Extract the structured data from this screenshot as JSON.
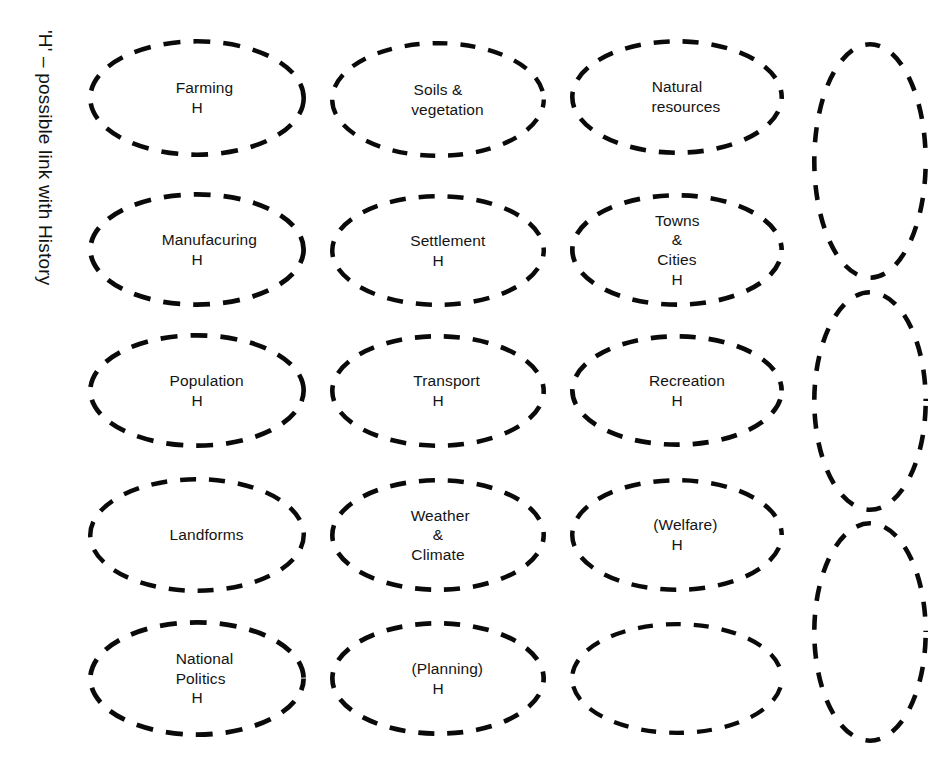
{
  "legend": {
    "text": "'H' – possible link with History"
  },
  "style": {
    "stroke_color": "#0a0a0a",
    "background": "#ffffff",
    "text_color": "#141414"
  },
  "grid": {
    "columns": 4,
    "rows": 5
  },
  "nodes": [
    {
      "id": "farming",
      "label": "Farming",
      "h": "H",
      "row": 1,
      "col": 1,
      "x": 88,
      "y": 39,
      "w": 218,
      "h_px": 118,
      "dash": "17 13",
      "width_px": 4.6
    },
    {
      "id": "soils",
      "label": "Soils &\nvegetation",
      "h": "",
      "row": 1,
      "col": 2,
      "x": 330,
      "y": 41,
      "w": 216,
      "h_px": 117,
      "dash": "15 13",
      "width_px": 4.4
    },
    {
      "id": "natural",
      "label": "Natural\nresources",
      "h": "",
      "row": 1,
      "col": 3,
      "x": 570,
      "y": 39,
      "w": 214,
      "h_px": 116,
      "dash": "16 13",
      "width_px": 4.6
    },
    {
      "id": "tall-1",
      "label": "",
      "h": "",
      "row": 1,
      "col": 4,
      "x": 812,
      "y": 42,
      "w": 116,
      "h_px": 238,
      "dash": "15 14",
      "width_px": 4.6
    },
    {
      "id": "manufacturing",
      "label": "Manufacuring",
      "h": "H",
      "row": 2,
      "col": 1,
      "x": 88,
      "y": 192,
      "w": 218,
      "h_px": 115,
      "dash": "17 13",
      "width_px": 4.8
    },
    {
      "id": "settlement",
      "label": "Settlement",
      "h": "H",
      "row": 2,
      "col": 2,
      "x": 330,
      "y": 194,
      "w": 216,
      "h_px": 113,
      "dash": "16 13",
      "width_px": 4.5
    },
    {
      "id": "towns-cities",
      "label": "Towns &\nCities",
      "h": "H",
      "row": 2,
      "col": 3,
      "x": 570,
      "y": 193,
      "w": 214,
      "h_px": 114,
      "dash": "16 13",
      "width_px": 4.7
    },
    {
      "id": "tall-2",
      "label": "",
      "h": "",
      "row": 2,
      "col": 4,
      "x": 812,
      "y": 290,
      "w": 116,
      "h_px": 222,
      "dash": "15 14",
      "width_px": 4.6
    },
    {
      "id": "population",
      "label": "Population",
      "h": "H",
      "row": 3,
      "col": 1,
      "x": 88,
      "y": 333,
      "w": 218,
      "h_px": 115,
      "dash": "17 13",
      "width_px": 4.7
    },
    {
      "id": "transport",
      "label": "Transport",
      "h": "H",
      "row": 3,
      "col": 2,
      "x": 330,
      "y": 334,
      "w": 216,
      "h_px": 114,
      "dash": "16 13",
      "width_px": 4.6
    },
    {
      "id": "recreation",
      "label": "Recreation",
      "h": "H",
      "row": 3,
      "col": 3,
      "x": 570,
      "y": 334,
      "w": 214,
      "h_px": 113,
      "dash": "16 13",
      "width_px": 4.7
    },
    {
      "id": "landforms",
      "label": "Landforms",
      "h": "",
      "row": 4,
      "col": 1,
      "x": 88,
      "y": 477,
      "w": 218,
      "h_px": 116,
      "dash": "16 13",
      "width_px": 4.5
    },
    {
      "id": "weather",
      "label": "Weather &\nClimate",
      "h": "",
      "row": 4,
      "col": 2,
      "x": 330,
      "y": 478,
      "w": 216,
      "h_px": 114,
      "dash": "16 13",
      "width_px": 4.6
    },
    {
      "id": "welfare",
      "label": "(Welfare)",
      "h": "H",
      "row": 4,
      "col": 3,
      "x": 570,
      "y": 478,
      "w": 214,
      "h_px": 114,
      "dash": "16 13",
      "width_px": 4.5
    },
    {
      "id": "tall-3",
      "label": "",
      "h": "",
      "row": 4,
      "col": 4,
      "x": 812,
      "y": 521,
      "w": 116,
      "h_px": 222,
      "dash": "15 14",
      "width_px": 4.6
    },
    {
      "id": "national-politics",
      "label": "National\nPolitics",
      "h": "H",
      "row": 5,
      "col": 1,
      "x": 88,
      "y": 620,
      "w": 218,
      "h_px": 117,
      "dash": "17 13",
      "width_px": 4.8
    },
    {
      "id": "planning",
      "label": "(Planning)",
      "h": "H",
      "row": 5,
      "col": 2,
      "x": 330,
      "y": 621,
      "w": 216,
      "h_px": 115,
      "dash": "16 13",
      "width_px": 4.7
    },
    {
      "id": "empty-r5c3",
      "label": "",
      "h": "",
      "row": 5,
      "col": 3,
      "x": 570,
      "y": 622,
      "w": 214,
      "h_px": 113,
      "dash": "15 13",
      "width_px": 4.3
    }
  ]
}
